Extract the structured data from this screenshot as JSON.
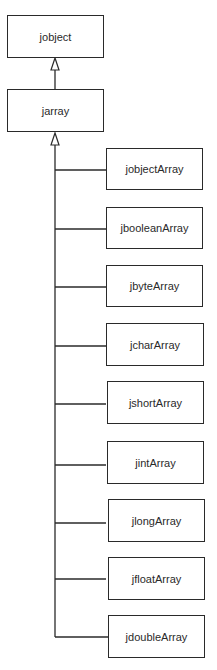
{
  "diagram": {
    "type": "class-hierarchy",
    "root": {
      "label": "jobject"
    },
    "parent": {
      "label": "jarray"
    },
    "children": [
      {
        "label": "jobjectArray"
      },
      {
        "label": "jbooleanArray"
      },
      {
        "label": "jbyteArray"
      },
      {
        "label": "jcharArray"
      },
      {
        "label": "jshortArray"
      },
      {
        "label": "jintArray"
      },
      {
        "label": "jlongArray"
      },
      {
        "label": "jfloatArray"
      },
      {
        "label": "jdoubleArray"
      }
    ],
    "edges": [
      {
        "from": "jarray",
        "to": "jobject",
        "kind": "inheritance"
      },
      {
        "from": "jobjectArray",
        "to": "jarray",
        "kind": "inheritance"
      },
      {
        "from": "jbooleanArray",
        "to": "jarray",
        "kind": "inheritance"
      },
      {
        "from": "jbyteArray",
        "to": "jarray",
        "kind": "inheritance"
      },
      {
        "from": "jcharArray",
        "to": "jarray",
        "kind": "inheritance"
      },
      {
        "from": "jshortArray",
        "to": "jarray",
        "kind": "inheritance"
      },
      {
        "from": "jintArray",
        "to": "jarray",
        "kind": "inheritance"
      },
      {
        "from": "jlongArray",
        "to": "jarray",
        "kind": "inheritance"
      },
      {
        "from": "jfloatArray",
        "to": "jarray",
        "kind": "inheritance"
      },
      {
        "from": "jdoubleArray",
        "to": "jarray",
        "kind": "inheritance"
      }
    ]
  }
}
